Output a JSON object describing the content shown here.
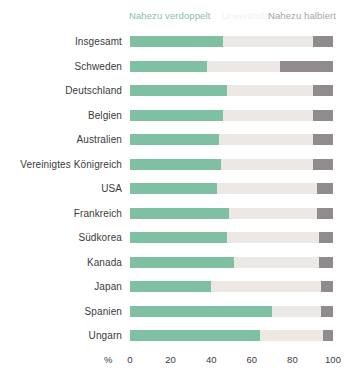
{
  "chart_data": {
    "type": "bar",
    "subtype": "stacked-horizontal",
    "title": "",
    "subtitle": "",
    "xlabel": "%",
    "ylabel": "",
    "xlim": [
      0,
      100
    ],
    "grid": false,
    "legend_position": "top",
    "categories": [
      "Insgesamt",
      "Schweden",
      "Deutschland",
      "Belgien",
      "Australien",
      "Vereinigtes Königreich",
      "USA",
      "Frankreich",
      "Südkorea",
      "Kanada",
      "Japan",
      "Spanien",
      "Ungarn"
    ],
    "series": [
      {
        "name": "Nahezu verdoppelt",
        "color": "#7fbfa2",
        "values": [
          46,
          38,
          48,
          46,
          44,
          45,
          43,
          49,
          48,
          51,
          40,
          70,
          64
        ]
      },
      {
        "name": "Unverändert",
        "color": "#ece8e5",
        "values": [
          44,
          36,
          42,
          44,
          46,
          45,
          49,
          43,
          45,
          42,
          54,
          24,
          31
        ]
      },
      {
        "name": "Nahezu halbiert",
        "color": "#918b8d",
        "values": [
          10,
          26,
          10,
          10,
          10,
          10,
          8,
          8,
          7,
          7,
          6,
          6,
          5
        ]
      }
    ],
    "xticks": [
      "0",
      "20",
      "40",
      "60",
      "80",
      "100"
    ],
    "xtick_values": [
      0,
      20,
      40,
      60,
      80,
      100
    ]
  },
  "legend": {
    "left_label": "Nahezu verdoppelt",
    "middle_label": "Unverändert",
    "right_label": "Nahezu halbiert"
  },
  "axis": {
    "unit": "%"
  },
  "colors": {
    "green": "#7fbfa2",
    "middle": "#ece8e5",
    "dark": "#918b8d",
    "background": "#ffffff",
    "text": "#3b3b3b"
  }
}
